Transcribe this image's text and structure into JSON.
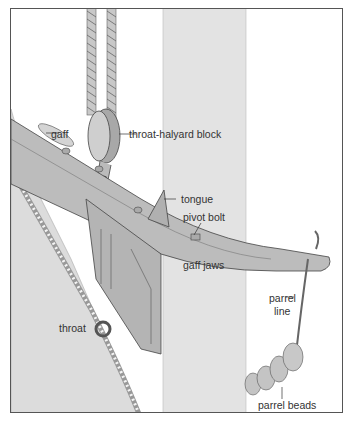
{
  "diagram": {
    "colors": {
      "mast": "#e3e3e3",
      "sail": "#dcdcdc",
      "metal": "#bcbcbc",
      "metal_dark": "#9a9a9a",
      "rope": "#c8c8c8",
      "line": "#333333",
      "frame": "#555555"
    },
    "labels": {
      "gaff": "gaff",
      "throat_halyard_block": "throat-halyard block",
      "tongue": "tongue",
      "pivot_bolt": "pivot bolt",
      "gaff_jaws": "gaff jaws",
      "parrel_line_1": "parrel",
      "parrel_line_2": "line",
      "throat": "throat",
      "parrel_beads": "parrel beads"
    }
  }
}
